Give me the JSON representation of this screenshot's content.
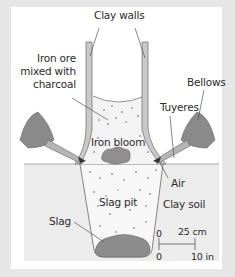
{
  "diagram": {
    "labels": {
      "clay_walls": "Clay walls",
      "iron_ore_line1": "Iron ore",
      "iron_ore_line2": "mixed with",
      "iron_ore_line3": "charcoal",
      "bellows": "Bellows",
      "tuyeres": "Tuyeres",
      "iron_bloom": "Iron bloom",
      "air": "Air",
      "slag_pit": "Slag pit",
      "clay_soil": "Clay soil",
      "slag": "Slag"
    },
    "scale_bar": {
      "top_zero": "0",
      "top_label": "25 cm",
      "bottom_zero": "0",
      "bottom_label": "10 in"
    },
    "colors": {
      "frame": "#e6e6e6",
      "panel": "#ffffff",
      "soil": "#ececec",
      "wall": "#c9c9c9",
      "bellows": "#8a8a8a",
      "slag": "#8c8c8c",
      "line": "#555555"
    }
  }
}
